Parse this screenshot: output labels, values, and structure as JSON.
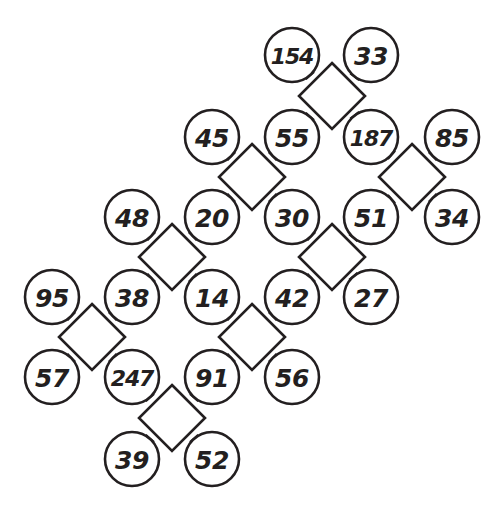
{
  "diagram": {
    "type": "number-puzzle-diamond-grid",
    "title": "",
    "geometry": {
      "width": 499,
      "height": 508,
      "circle_radius": 27,
      "diamond_half_diagonal": 33,
      "grid_spacing": 80,
      "stroke_color": "#231f20",
      "fill_color": "#ffffff",
      "background": "#ffffff"
    },
    "circles": [
      {
        "id": "c-154",
        "value": "154",
        "cx": 292,
        "cy": 55
      },
      {
        "id": "c-33",
        "value": "33",
        "cx": 371,
        "cy": 55
      },
      {
        "id": "c-45",
        "value": "45",
        "cx": 212,
        "cy": 137
      },
      {
        "id": "c-55",
        "value": "55",
        "cx": 292,
        "cy": 137
      },
      {
        "id": "c-187",
        "value": "187",
        "cx": 371,
        "cy": 137
      },
      {
        "id": "c-85",
        "value": "85",
        "cx": 452,
        "cy": 137
      },
      {
        "id": "c-48",
        "value": "48",
        "cx": 132,
        "cy": 217
      },
      {
        "id": "c-20",
        "value": "20",
        "cx": 212,
        "cy": 217
      },
      {
        "id": "c-30",
        "value": "30",
        "cx": 292,
        "cy": 217
      },
      {
        "id": "c-51",
        "value": "51",
        "cx": 371,
        "cy": 217
      },
      {
        "id": "c-34",
        "value": "34",
        "cx": 452,
        "cy": 217
      },
      {
        "id": "c-95",
        "value": "95",
        "cx": 52,
        "cy": 297
      },
      {
        "id": "c-38",
        "value": "38",
        "cx": 132,
        "cy": 297
      },
      {
        "id": "c-14",
        "value": "14",
        "cx": 212,
        "cy": 297
      },
      {
        "id": "c-42",
        "value": "42",
        "cx": 292,
        "cy": 297
      },
      {
        "id": "c-27",
        "value": "27",
        "cx": 371,
        "cy": 297
      },
      {
        "id": "c-57",
        "value": "57",
        "cx": 52,
        "cy": 377
      },
      {
        "id": "c-247",
        "value": "247",
        "cx": 132,
        "cy": 377
      },
      {
        "id": "c-91",
        "value": "91",
        "cx": 212,
        "cy": 377
      },
      {
        "id": "c-56",
        "value": "56",
        "cx": 292,
        "cy": 377
      },
      {
        "id": "c-39",
        "value": "39",
        "cx": 132,
        "cy": 459
      },
      {
        "id": "c-52",
        "value": "52",
        "cx": 212,
        "cy": 459
      }
    ],
    "diamonds": [
      {
        "id": "d-1",
        "cx": 332,
        "cy": 96,
        "corners": [
          "c-154",
          "c-33",
          "c-55",
          "c-187"
        ]
      },
      {
        "id": "d-2",
        "cx": 252,
        "cy": 177,
        "corners": [
          "c-45",
          "c-55",
          "c-20",
          "c-30"
        ]
      },
      {
        "id": "d-3",
        "cx": 412,
        "cy": 177,
        "corners": [
          "c-187",
          "c-85",
          "c-51",
          "c-34"
        ]
      },
      {
        "id": "d-4",
        "cx": 172,
        "cy": 257,
        "corners": [
          "c-48",
          "c-20",
          "c-38",
          "c-14"
        ]
      },
      {
        "id": "d-5",
        "cx": 332,
        "cy": 257,
        "corners": [
          "c-30",
          "c-51",
          "c-42",
          "c-27"
        ]
      },
      {
        "id": "d-6",
        "cx": 92,
        "cy": 337,
        "corners": [
          "c-95",
          "c-38",
          "c-57",
          "c-247"
        ]
      },
      {
        "id": "d-7",
        "cx": 252,
        "cy": 337,
        "corners": [
          "c-14",
          "c-42",
          "c-91",
          "c-56"
        ]
      },
      {
        "id": "d-8",
        "cx": 172,
        "cy": 418,
        "corners": [
          "c-247",
          "c-91",
          "c-39",
          "c-52"
        ]
      }
    ]
  }
}
